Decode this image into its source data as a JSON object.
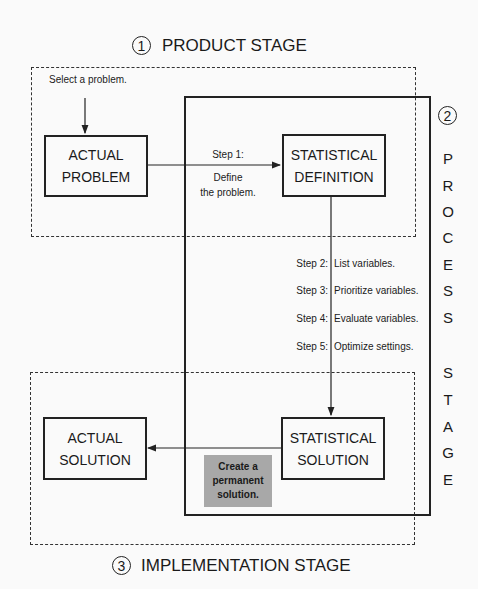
{
  "stages": {
    "product": {
      "number": "1",
      "title": "PRODUCT STAGE"
    },
    "process": {
      "number": "2",
      "letters": [
        "P",
        "R",
        "O",
        "C",
        "E",
        "S",
        "S",
        "",
        "S",
        "T",
        "A",
        "G",
        "E"
      ]
    },
    "implementation": {
      "number": "3",
      "title": "IMPLEMENTATION STAGE"
    }
  },
  "start_note": "Select a problem.",
  "boxes": {
    "actual_problem": [
      "ACTUAL",
      "PROBLEM"
    ],
    "statistical_definition": [
      "STATISTICAL",
      "DEFINITION"
    ],
    "statistical_solution": [
      "STATISTICAL",
      "SOLUTION"
    ],
    "actual_solution": [
      "ACTUAL",
      "SOLUTION"
    ]
  },
  "step1": {
    "label": "Step 1:",
    "desc_line1": "Define",
    "desc_line2": "the problem."
  },
  "steps": [
    {
      "label": "Step 2:",
      "desc": "List variables."
    },
    {
      "label": "Step 3:",
      "desc": "Prioritize variables."
    },
    {
      "label": "Step 4:",
      "desc": "Evaluate variables."
    },
    {
      "label": "Step 5:",
      "desc": "Optimize settings."
    }
  ],
  "permanent_note": [
    "Create a",
    "permanent",
    "solution."
  ],
  "colors": {
    "line": "#222222",
    "note_fill": "#a8a8a8",
    "background": "#fafafa"
  }
}
